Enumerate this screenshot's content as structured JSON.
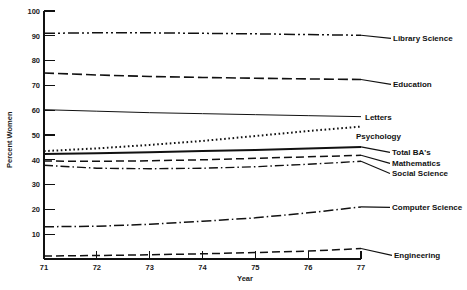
{
  "chart_data": {
    "type": "line",
    "title": "",
    "xlabel": "Year",
    "ylabel": "Percent Women",
    "xlim": [
      71,
      77
    ],
    "ylim": [
      0,
      100
    ],
    "grid": false,
    "legend_position": "right-inline-labels",
    "x": [
      71,
      72,
      73,
      74,
      75,
      76,
      77
    ],
    "xticklabels": [
      "71",
      "72",
      "73",
      "74",
      "75",
      "76",
      "77"
    ],
    "yticks": [
      0,
      10,
      20,
      30,
      40,
      50,
      60,
      70,
      80,
      90,
      100
    ],
    "yticklabels": [
      "",
      "10",
      "20",
      "30",
      "40",
      "50",
      "60",
      "70",
      "80",
      "90",
      "100"
    ],
    "series": [
      {
        "name": "Library Science",
        "label": "Library Science",
        "linestyle": "dash-dot-dot",
        "dasharray": "11,3,2,3,2,3",
        "width": 1.5,
        "values": [
          91.0,
          91.2,
          91.2,
          91.0,
          90.8,
          90.5,
          90.2
        ]
      },
      {
        "name": "Education",
        "label": "Education",
        "linestyle": "long-dash",
        "dasharray": "10,4",
        "width": 1.6,
        "values": [
          75.0,
          74.2,
          73.6,
          73.2,
          72.9,
          72.6,
          72.4
        ]
      },
      {
        "name": "Letters",
        "label": "Letters",
        "linestyle": "solid-thin",
        "dasharray": "",
        "width": 1.0,
        "values": [
          60.2,
          59.6,
          59.0,
          58.6,
          58.2,
          57.8,
          57.4
        ]
      },
      {
        "name": "Psychology",
        "label": "Psychology",
        "linestyle": "dotted",
        "dasharray": "1.6,2.6",
        "width": 2.0,
        "values": [
          43.5,
          44.6,
          46.0,
          47.6,
          49.6,
          51.6,
          53.4
        ]
      },
      {
        "name": "Total BA's",
        "label": "Total BA's",
        "linestyle": "solid-thick",
        "dasharray": "",
        "width": 2.0,
        "values": [
          42.3,
          42.6,
          43.0,
          43.5,
          44.0,
          44.6,
          45.2
        ]
      },
      {
        "name": "Mathematics",
        "label": "Mathematics",
        "linestyle": "dashed",
        "dasharray": "8,4",
        "width": 1.5,
        "values": [
          39.5,
          39.4,
          39.6,
          40.0,
          40.6,
          41.2,
          41.8
        ]
      },
      {
        "name": "Social Science",
        "label": "Social Science",
        "linestyle": "dash-dot",
        "dasharray": "9,3,1.5,3",
        "width": 1.4,
        "values": [
          37.8,
          36.6,
          36.4,
          36.6,
          37.2,
          38.2,
          39.4
        ]
      },
      {
        "name": "Computer Science",
        "label": "Computer Science",
        "linestyle": "dash-dot",
        "dasharray": "10,3,1.5,3",
        "width": 1.5,
        "values": [
          13.0,
          13.2,
          14.0,
          15.2,
          16.6,
          18.6,
          21.0
        ]
      },
      {
        "name": "Engineering",
        "label": "Engineering",
        "linestyle": "dashed",
        "dasharray": "8,4",
        "width": 1.5,
        "values": [
          1.2,
          1.4,
          1.7,
          2.1,
          2.6,
          3.2,
          4.2
        ]
      }
    ]
  },
  "axes": {
    "y_axis_title": "Percent Women",
    "x_axis_title": "Year"
  },
  "colors": {
    "ink": "#111111",
    "background": "#ffffff"
  }
}
